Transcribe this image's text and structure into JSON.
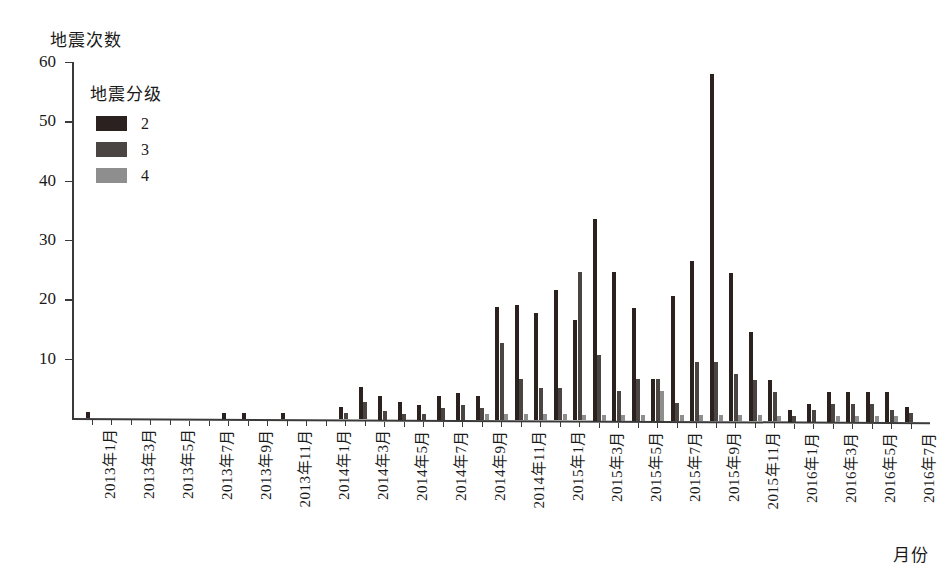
{
  "chart_data": {
    "type": "bar",
    "title": "",
    "ylabel": "地震次数",
    "xlabel": "月份",
    "ylim": [
      0,
      60
    ],
    "yticks": [
      0,
      10,
      20,
      30,
      40,
      50,
      60
    ],
    "ytick_labels": [
      "",
      "10",
      "20",
      "30",
      "40",
      "50",
      "60"
    ],
    "grid": false,
    "legend": {
      "title": "地震分级",
      "position": "upper-left-inside",
      "entries": [
        {
          "label": "2",
          "color": "#2b211e"
        },
        {
          "label": "3",
          "color": "#4a4543"
        },
        {
          "label": "4",
          "color": "#8e8e8e"
        }
      ]
    },
    "categories": [
      "2013年1月",
      "2013年2月",
      "2013年3月",
      "2013年4月",
      "2013年5月",
      "2013年6月",
      "2013年7月",
      "2013年8月",
      "2013年9月",
      "2013年10月",
      "2013年11月",
      "2013年12月",
      "2014年1月",
      "2014年2月",
      "2014年3月",
      "2014年4月",
      "2014年5月",
      "2014年6月",
      "2014年7月",
      "2014年8月",
      "2014年9月",
      "2014年10月",
      "2014年11月",
      "2014年12月",
      "2015年1月",
      "2015年2月",
      "2015年3月",
      "2015年4月",
      "2015年5月",
      "2015年6月",
      "2015年7月",
      "2015年8月",
      "2015年9月",
      "2015年10月",
      "2015年11月",
      "2015年12月",
      "2016年1月",
      "2016年2月",
      "2016年3月",
      "2016年4月",
      "2016年5月",
      "2016年6月",
      "2016年7月"
    ],
    "tick_label_indices": [
      0,
      2,
      4,
      6,
      8,
      10,
      12,
      14,
      16,
      18,
      20,
      22,
      24,
      26,
      28,
      30,
      32,
      34,
      36,
      38,
      40,
      42
    ],
    "series": [
      {
        "name": "2",
        "color": "#2b211e",
        "values": [
          1,
          0,
          0,
          0,
          0,
          0,
          0,
          1,
          1,
          0,
          1,
          0,
          0,
          2,
          5.5,
          4,
          3,
          2.5,
          4,
          4.5,
          4,
          19,
          19.5,
          18,
          22,
          17,
          34,
          25,
          19,
          7,
          21,
          27,
          58.5,
          25,
          15,
          7,
          2,
          3,
          5,
          5,
          5,
          5,
          2.5
        ]
      },
      {
        "name": "3",
        "color": "#4a4543",
        "values": [
          0,
          0,
          0,
          0,
          0,
          0,
          0,
          0,
          0,
          0,
          0,
          0,
          0,
          1,
          3,
          1.5,
          1,
          1,
          2,
          2.5,
          2,
          13,
          7,
          5.5,
          5.5,
          25,
          11,
          5,
          7,
          7,
          3,
          10,
          10,
          8,
          7,
          5,
          1,
          2,
          3,
          3,
          3,
          2,
          1.5
        ]
      },
      {
        "name": "4",
        "color": "#8e8e8e",
        "values": [
          0,
          0,
          0,
          0,
          0,
          0,
          0,
          0,
          0,
          0,
          0,
          0,
          0,
          0,
          0,
          0,
          0,
          0,
          0,
          0,
          1,
          1,
          1,
          1,
          1,
          1,
          1,
          1,
          1,
          5,
          1,
          1,
          1,
          1,
          1,
          1,
          0,
          0,
          1,
          1,
          1,
          1,
          0
        ]
      }
    ]
  }
}
